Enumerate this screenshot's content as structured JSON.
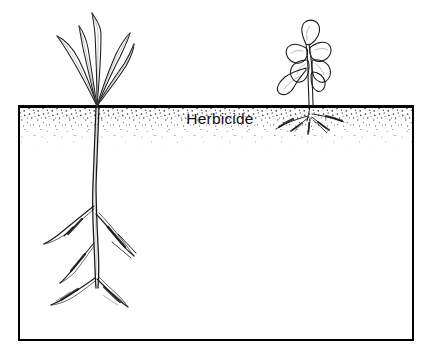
{
  "figure": {
    "kind": "scientific-line-drawing",
    "background_color": "#ffffff",
    "ink_color": "#000000"
  },
  "soil_box": {
    "label": "Herbicide",
    "label_x": 220,
    "label_y": 124,
    "border_color": "#000000",
    "border_width": 2,
    "x": 19,
    "y": 106,
    "width": 394,
    "height": 234,
    "fill_color": "#ffffff"
  },
  "herbicide_band": {
    "name": "stippled herbicide zone",
    "top": 108,
    "bottom": 146,
    "stipple_color": "#4a4a4a",
    "description": "Dense stipple at top fading downward"
  },
  "plants": [
    {
      "id": "tolerant-grass",
      "name": "grass-seedling-left",
      "leaf_type": "narrow grass-like blades",
      "leaf_count": 5,
      "condition": "healthy",
      "crown_x": 97,
      "crown_y": 107,
      "root_type": "deep branched taproot",
      "root_depth_y": 300,
      "description": "Healthy grass seedling with upright blades and deep root system extending well below the herbicide layer"
    },
    {
      "id": "susceptible-broadleaf",
      "name": "broadleaf-seedling-right",
      "leaf_type": "broad wilted leaves",
      "leaf_count": 6,
      "condition": "wilted",
      "crown_x": 311,
      "crown_y": 107,
      "root_type": "shallow stunted roots",
      "root_depth_y": 130,
      "description": "Wilted broadleaf seedling with curled drooping leaves and shallow stunted roots confined to the herbicide layer"
    }
  ]
}
